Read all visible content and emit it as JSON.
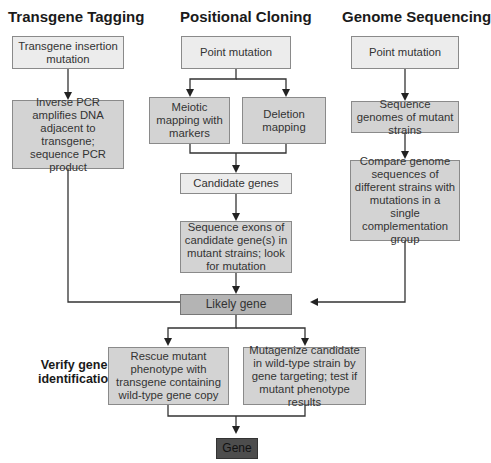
{
  "columns": {
    "transgene_tagging": {
      "heading": "Transgene Tagging",
      "box1": "Transgene insertion mutation",
      "box2": "Inverse PCR amplifies DNA adjacent to transgene; sequence PCR product"
    },
    "positional_cloning": {
      "heading": "Positional Cloning",
      "box1": "Point mutation",
      "box2a": "Meiotic mapping with markers",
      "box2b": "Deletion mapping",
      "box3": "Candidate genes",
      "box4": "Sequence exons of candidate gene(s) in mutant strains; look for mutation"
    },
    "genome_sequencing": {
      "heading": "Genome Sequencing",
      "box1": "Point mutation",
      "box2": "Sequence genomes of mutant strains",
      "box3": "Compare genome sequences of different strains with mutations in a single complementation group"
    }
  },
  "convergence": {
    "likely_gene": "Likely gene"
  },
  "verification": {
    "label": "Verify gene identification",
    "rescue": "Rescue mutant phenotype with transgene containing wild-type gene copy",
    "mutagenize": "Mutagenize candidate in wild-type strain by gene targeting; test if mutant phenotype results"
  },
  "result": {
    "gene": "Gene"
  },
  "colors": {
    "light_box": "#ececec",
    "mid_box": "#d3d3d3",
    "likely_gene_box": "#b4b4b4",
    "gene_box": "#4d4d4d",
    "lines": "#333333"
  }
}
